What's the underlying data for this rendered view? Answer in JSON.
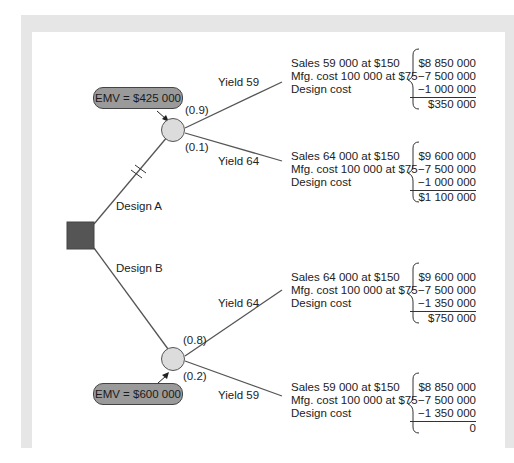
{
  "decision_node": {
    "label": "decision",
    "color": "#555555"
  },
  "branches": [
    {
      "label": "Design A",
      "pruned": true,
      "emv": "EMV = $425 000",
      "outcomes": [
        {
          "prob": "(0.9)",
          "yield_label": "Yield 59",
          "lines": [
            "Sales 59 000 at $150",
            "Mfg. cost 100 000 at $75",
            "Design cost"
          ],
          "values": [
            "$8 850 000",
            "−7 500 000",
            "−1 000 000"
          ],
          "result": "$350 000"
        },
        {
          "prob": "(0.1)",
          "yield_label": "Yield 64",
          "lines": [
            "Sales 64 000 at $150",
            "Mfg. cost 100 000 at $75",
            "Design cost"
          ],
          "values": [
            "$9 600 000",
            "−7 500 000",
            "−1 000 000"
          ],
          "result": "$1 100 000"
        }
      ]
    },
    {
      "label": "Design B",
      "pruned": false,
      "emv": "EMV = $600 000",
      "outcomes": [
        {
          "prob": "(0.8)",
          "yield_label": "Yield 64",
          "lines": [
            "Sales 64 000 at $150",
            "Mfg. cost 100 000 at $75",
            "Design cost"
          ],
          "values": [
            "$9 600 000",
            "−7 500 000",
            "−1 350 000"
          ],
          "result": "$750 000"
        },
        {
          "prob": "(0.2)",
          "yield_label": "Yield 59",
          "lines": [
            "Sales 59 000 at $150",
            "Mfg. cost 100 000 at $75",
            "Design cost"
          ],
          "values": [
            "$8 850 000",
            "−7 500 000",
            "−1 350 000"
          ],
          "result": "0"
        }
      ]
    }
  ]
}
